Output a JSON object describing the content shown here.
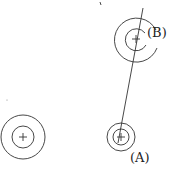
{
  "diagram": {
    "labels": {
      "b": "(B)",
      "a": "(A)"
    },
    "colors": {
      "line": "#333333",
      "background": "#ffffff"
    },
    "circles": [
      {
        "id": "left",
        "cx": 23,
        "cy": 137,
        "outer_r": 22,
        "inner_r": 11
      },
      {
        "id": "A",
        "cx": 121,
        "cy": 137,
        "outer_r": 14,
        "inner_r": 8
      },
      {
        "id": "B",
        "cx": 136,
        "cy": 39,
        "outer_r": 22,
        "inner_r": 11
      }
    ],
    "axis_line": {
      "x1": 143,
      "y1": 8,
      "x2": 118,
      "y2": 143
    }
  }
}
